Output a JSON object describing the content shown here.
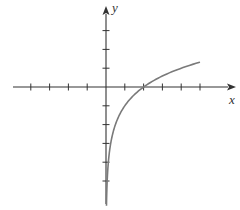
{
  "chart_data": {
    "type": "line",
    "title": "",
    "xlabel": "x",
    "ylabel": "y",
    "xlim": [
      -4,
      5
    ],
    "ylim": [
      -6,
      3
    ],
    "grid": false,
    "legend": null,
    "x_ticks": [
      -4,
      -3,
      -2,
      -1,
      1,
      2,
      3,
      4,
      5
    ],
    "y_ticks": [
      -5,
      -4,
      -3,
      -2,
      -1,
      1,
      2,
      3
    ],
    "tick_labels_shown": false,
    "series": [
      {
        "name": "curve",
        "description": "logarithmic curve y = log2(x) - 1, vertical asymptote at x = 0, x-intercept at x = 2",
        "x": [
          0.04,
          0.0625,
          0.125,
          0.25,
          0.5,
          1,
          2,
          3,
          4,
          5
        ],
        "y": [
          -5.64,
          -5,
          -4,
          -3,
          -2,
          -1,
          0,
          0.58,
          1,
          1.32
        ]
      }
    ],
    "annotations": [
      {
        "text": "x-intercept",
        "x": 2,
        "y": 0
      }
    ]
  },
  "labels": {
    "x_axis": "x",
    "y_axis": "y"
  },
  "colors": {
    "axis": "#333333",
    "curve": "#7a7a7a",
    "background": "#ffffff"
  }
}
